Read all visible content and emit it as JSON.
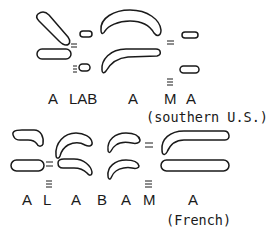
{
  "diagram": {
    "type": "gestural-score",
    "colors": {
      "stroke": "#1a1a1a",
      "background": "#ffffff"
    },
    "panels": [
      {
        "id": "southern-us",
        "segments": [
          "A",
          "LAB",
          "A",
          "M",
          "A"
        ],
        "note": "(southern U.S.)"
      },
      {
        "id": "french",
        "segments": [
          "A",
          "L",
          "A",
          "B",
          "A",
          "M",
          "A"
        ],
        "note": "(French)"
      }
    ]
  }
}
